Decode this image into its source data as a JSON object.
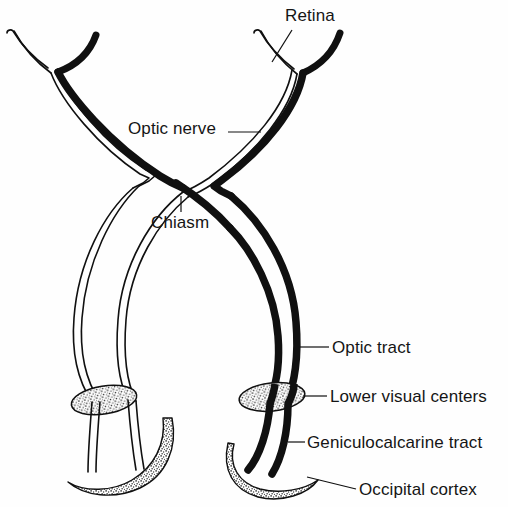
{
  "figure": {
    "background_color": "#fefefe",
    "ink_color": "#101010"
  },
  "labels": {
    "retina": "Retina",
    "optic_nerve": "Optic nerve",
    "chiasm": "Chiasm",
    "optic_tract": "Optic tract",
    "lower_visual_centers": "Lower visual centers",
    "geniculocalcarine_tract": "Geniculocalcarine tract",
    "occipital_cortex": "Occipital cortex"
  },
  "structures": [
    {
      "name": "left-retina",
      "style": "arc-pair-hollow-and-solid",
      "side": "left"
    },
    {
      "name": "right-retina",
      "style": "arc-pair-hollow-and-solid",
      "side": "right"
    },
    {
      "name": "optic-chiasm",
      "style": "x-crossing"
    },
    {
      "name": "left-optic-tract",
      "style": "hollow-outline"
    },
    {
      "name": "right-optic-tract",
      "style": "solid-black"
    },
    {
      "name": "left-lower-visual-center",
      "style": "stippled-ellipse"
    },
    {
      "name": "right-lower-visual-center",
      "style": "stippled-ellipse"
    },
    {
      "name": "left-occipital-cortex",
      "style": "stippled-crescent"
    },
    {
      "name": "right-occipital-cortex",
      "style": "stippled-crescent"
    }
  ]
}
